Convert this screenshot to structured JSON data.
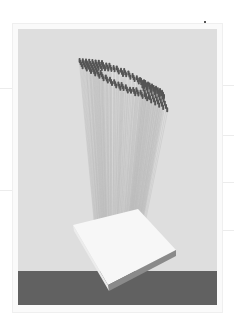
{
  "poster": {
    "subject": "pin-art tower sculpture on white base",
    "logo_text": "ebvf",
    "caption_lines": [
      "",
      "",
      "",
      ""
    ],
    "colors": {
      "page": "#ffffff",
      "panel": "#dedede",
      "band": "#616161",
      "pin": "#555555",
      "slab": "#f6f6f6",
      "logo": "#1a1a1a"
    }
  }
}
